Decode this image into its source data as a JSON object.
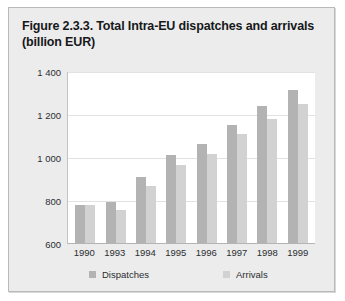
{
  "figure": {
    "title": "Figure 2.3.3. Total Intra-EU dispatches and arrivals (billion EUR)",
    "card_bg": "#ececed",
    "border_color": "#b9b9ba"
  },
  "chart_data": {
    "type": "bar",
    "title": "Figure 2.3.3. Total Intra-EU dispatches and arrivals (billion EUR)",
    "xlabel": "",
    "ylabel": "",
    "ylim": [
      600,
      1400
    ],
    "yticks": [
      600,
      800,
      1000,
      1200,
      1400
    ],
    "ytick_labels": [
      "600",
      "800",
      "1 000",
      "1 200",
      "1 400"
    ],
    "grid": true,
    "legend_position": "bottom",
    "units": "billion EUR",
    "categories": [
      "1990",
      "1993",
      "1994",
      "1995",
      "1996",
      "1997",
      "1998",
      "1999"
    ],
    "series": [
      {
        "name": "Dispatches",
        "color": "#b3b3b3",
        "values": [
          775,
          790,
          905,
          1010,
          1060,
          1150,
          1235,
          1310
        ]
      },
      {
        "name": "Arrivals",
        "color": "#d2d2d2",
        "values": [
          775,
          755,
          865,
          965,
          1015,
          1105,
          1175,
          1245
        ]
      }
    ]
  }
}
